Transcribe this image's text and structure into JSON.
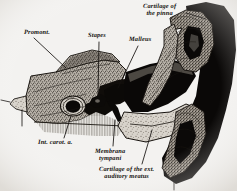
{
  "figure": {
    "background_color": "#f3f2f0",
    "ink_color": "#15120f",
    "width": 237,
    "height": 191,
    "style": "engraving"
  },
  "labels": {
    "cartilage_pinna": {
      "line1": "Cartilage of",
      "line2": "the pinna"
    },
    "promontory": {
      "line1": "Promont."
    },
    "stapes": {
      "line1": "Stapes"
    },
    "malleus": {
      "line1": "Malleus"
    },
    "int_carotid": {
      "line1": "Int. carot. a."
    },
    "membrana_tympani": {
      "line1": "Membrana",
      "line2": "tympani"
    },
    "cartilage_meatus": {
      "line1": "Cartilage of the ext.",
      "line2": "auditory meatus"
    }
  },
  "structures": [
    {
      "name": "petrous-temporal-bone",
      "texture": "stipple"
    },
    {
      "name": "tympanic-cavity",
      "texture": "solid-dark"
    },
    {
      "name": "malleus-ossicle",
      "texture": "solid-dark"
    },
    {
      "name": "stapes-ossicle",
      "texture": "solid-dark"
    },
    {
      "name": "internal-carotid-artery",
      "texture": "ring-void"
    },
    {
      "name": "external-auditory-meatus",
      "texture": "solid-dark"
    },
    {
      "name": "pinna-cartilage",
      "texture": "stipple-coil"
    },
    {
      "name": "soft-tissue-hatching",
      "texture": "hatch"
    }
  ]
}
